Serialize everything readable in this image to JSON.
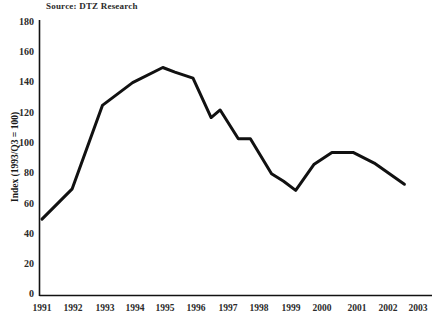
{
  "source_note": "Source: DTZ Research",
  "axes": {
    "y_title": "Index (1993/Q3 = 100)",
    "y_ticks": [
      180,
      160,
      140,
      120,
      100,
      80,
      60,
      40,
      20,
      0
    ],
    "x_ticks": [
      "1991",
      "1992",
      "1993",
      "1994",
      "1995",
      "1996",
      "1997",
      "1998",
      "1999",
      "2000",
      "2001",
      "2002",
      "2003"
    ]
  },
  "colors": {
    "line": "#111111",
    "axis": "#111111",
    "text": "#2b2b2b",
    "background": "#ffffff"
  },
  "chart_data": {
    "type": "line",
    "title": "",
    "subtitle": "",
    "xlabel": "",
    "ylabel": "Index (1993/Q3 = 100)",
    "xlim": [
      1991,
      2003.6
    ],
    "ylim": [
      0,
      180
    ],
    "grid": false,
    "legend": "none",
    "annotations": [
      "Source: DTZ Research"
    ],
    "x": [
      1991,
      1992,
      1993,
      1994,
      1995,
      1995.4,
      1996,
      1996.6,
      1996.9,
      1997.5,
      1997.9,
      1998.6,
      1999,
      1999.4,
      2000,
      2000.6,
      2001.3,
      2002,
      2003
    ],
    "series": [
      {
        "name": "Index",
        "values": [
          50,
          70,
          125,
          140,
          150,
          147,
          143,
          117,
          122,
          103,
          103,
          80,
          75,
          69,
          86,
          94,
          94,
          87,
          73
        ]
      }
    ]
  }
}
